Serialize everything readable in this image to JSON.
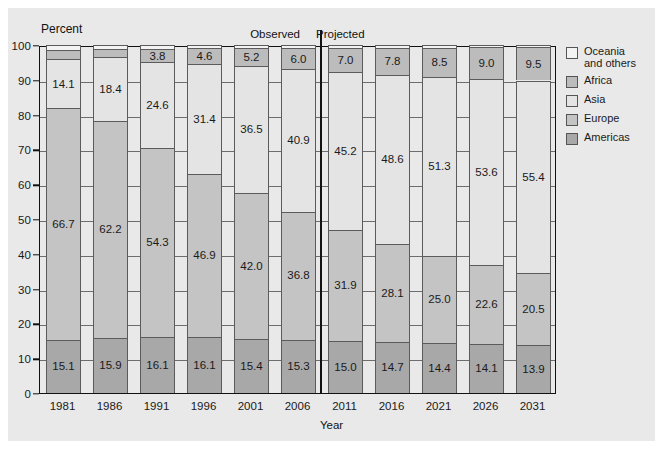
{
  "chart_data": {
    "type": "bar",
    "title": "",
    "xlabel": "Year",
    "ylabel": "Percent",
    "ylim": [
      0,
      100
    ],
    "yticks": [
      0,
      10,
      20,
      30,
      40,
      50,
      60,
      70,
      80,
      90,
      100
    ],
    "grid": true,
    "stacked": true,
    "legend_position": "right",
    "categories": [
      "1981",
      "1986",
      "1991",
      "1996",
      "2001",
      "2006",
      "2011",
      "2016",
      "2021",
      "2026",
      "2031"
    ],
    "series": [
      {
        "name": "Americas",
        "color": "#a8a8a8",
        "values": [
          15.1,
          15.9,
          16.1,
          16.1,
          15.4,
          15.3,
          15.0,
          14.7,
          14.4,
          14.1,
          13.9
        ]
      },
      {
        "name": "Europe",
        "color": "#c4c4c4",
        "values": [
          66.7,
          62.2,
          54.3,
          46.9,
          42.0,
          36.8,
          31.9,
          28.1,
          25.0,
          22.6,
          20.5
        ]
      },
      {
        "name": "Asia",
        "color": "#e4e4e4",
        "values": [
          14.1,
          18.4,
          24.6,
          31.4,
          36.5,
          40.9,
          45.2,
          48.6,
          51.3,
          53.6,
          55.4
        ]
      },
      {
        "name": "Africa",
        "color": "#bcbcbc",
        "values": [
          2.6,
          2.4,
          3.8,
          4.6,
          5.2,
          6.0,
          7.0,
          7.8,
          8.5,
          9.0,
          9.5
        ]
      },
      {
        "name": "Oceania and others",
        "color": "#f3f3f3",
        "values": [
          1.5,
          1.1,
          1.2,
          1.0,
          0.9,
          1.0,
          0.9,
          0.8,
          0.8,
          0.7,
          0.7
        ]
      }
    ],
    "labels_shown": {
      "Americas": [
        "15.1",
        "15.9",
        "16.1",
        "16.1",
        "15.4",
        "15.3",
        "15.0",
        "14.7",
        "14.4",
        "14.1",
        "13.9"
      ],
      "Europe": [
        "66.7",
        "62.2",
        "54.3",
        "46.9",
        "42.0",
        "36.8",
        "31.9",
        "28.1",
        "25.0",
        "22.6",
        "20.5"
      ],
      "Asia": [
        "14.1",
        "18.4",
        "24.6",
        "31.4",
        "36.5",
        "40.9",
        "45.2",
        "48.6",
        "51.3",
        "53.6",
        "55.4"
      ],
      "Africa": [
        "",
        "",
        "3.8",
        "4.6",
        "5.2",
        "6.0",
        "7.0",
        "7.8",
        "8.5",
        "9.0",
        "9.5"
      ],
      "Oceania and others": [
        "",
        "",
        "",
        "",
        "",
        "",
        "",
        "",
        "",
        "",
        ""
      ]
    },
    "annotations": [
      {
        "text": "Observed",
        "position": "above-left-of-divider"
      },
      {
        "text": "Projected",
        "position": "above-right-of-divider"
      }
    ],
    "divider_after_category": "2006"
  },
  "legend": {
    "items": [
      {
        "label_line1": "Oceania",
        "label_line2": "and others",
        "color": "#f3f3f3"
      },
      {
        "label_line1": "Africa",
        "label_line2": "",
        "color": "#bcbcbc"
      },
      {
        "label_line1": "Asia",
        "label_line2": "",
        "color": "#e4e4e4"
      },
      {
        "label_line1": "Europe",
        "label_line2": "",
        "color": "#c4c4c4"
      },
      {
        "label_line1": "Americas",
        "label_line2": "",
        "color": "#a8a8a8"
      }
    ]
  },
  "colors": {
    "panel_background": "#e9e9e9",
    "page_background": "#ffffff",
    "axis": "#111111",
    "gridline": "#6d6d6d",
    "segment_border": "#5b5b5b"
  }
}
